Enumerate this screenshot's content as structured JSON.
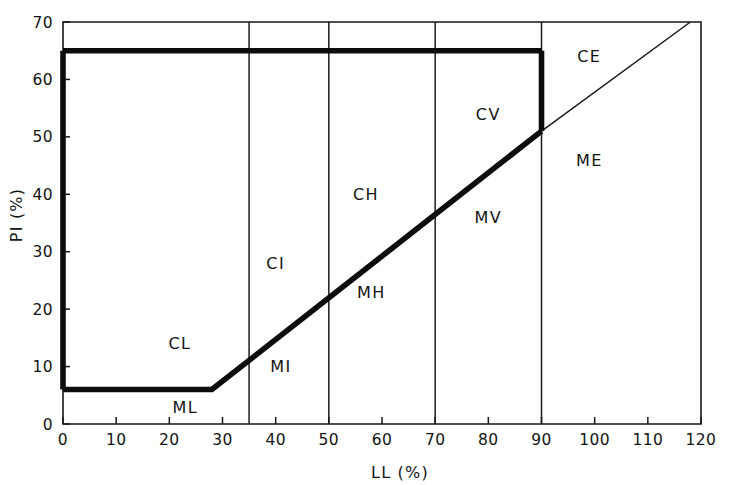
{
  "chart_data": {
    "type": "line",
    "title": "",
    "xlabel": "LL (%)",
    "ylabel": "PI (%)",
    "xlim": [
      0,
      120
    ],
    "ylim": [
      0,
      70
    ],
    "grid": false,
    "legend_position": "none",
    "x_ticks": [
      0,
      10,
      20,
      30,
      40,
      50,
      60,
      70,
      80,
      90,
      100,
      110,
      120
    ],
    "y_ticks": [
      0,
      10,
      20,
      30,
      40,
      50,
      60,
      70
    ],
    "x_tick_labels": [
      "0",
      "10",
      "20",
      "30",
      "40",
      "50",
      "60",
      "70",
      "80",
      "90",
      "100",
      "110",
      "120"
    ],
    "y_tick_labels": [
      "0",
      "10",
      "20",
      "30",
      "40",
      "50",
      "60",
      "70"
    ],
    "vertical_divider_lines": [
      35,
      50,
      70,
      90
    ],
    "series": [
      {
        "name": "A-line (bold)",
        "style": "bold",
        "points": [
          [
            0,
            6
          ],
          [
            28,
            6
          ],
          [
            90,
            51
          ]
        ]
      },
      {
        "name": "A-line extension (thin)",
        "style": "thin",
        "points": [
          [
            90,
            51
          ],
          [
            118,
            70
          ]
        ]
      },
      {
        "name": "Upper plasticity boundary (bold)",
        "style": "bold",
        "points": [
          [
            0,
            65
          ],
          [
            90,
            65
          ]
        ]
      },
      {
        "name": "Left vertical boundary (bold)",
        "style": "bold",
        "points": [
          [
            0,
            6
          ],
          [
            0,
            65
          ]
        ]
      },
      {
        "name": "Right vertical boundary at LL=90 (bold)",
        "style": "bold",
        "points": [
          [
            90,
            51
          ],
          [
            90,
            65
          ]
        ]
      }
    ],
    "annotations": [
      {
        "label": "CL",
        "x": 22,
        "y": 13
      },
      {
        "label": "ML",
        "x": 23,
        "y": 2
      },
      {
        "label": "CI",
        "x": 40,
        "y": 27
      },
      {
        "label": "MI",
        "x": 41,
        "y": 9
      },
      {
        "label": "CH",
        "x": 57,
        "y": 39
      },
      {
        "label": "MH",
        "x": 58,
        "y": 22
      },
      {
        "label": "CV",
        "x": 80,
        "y": 53
      },
      {
        "label": "MV",
        "x": 80,
        "y": 35
      },
      {
        "label": "CE",
        "x": 99,
        "y": 63
      },
      {
        "label": "ME",
        "x": 99,
        "y": 45
      }
    ]
  }
}
